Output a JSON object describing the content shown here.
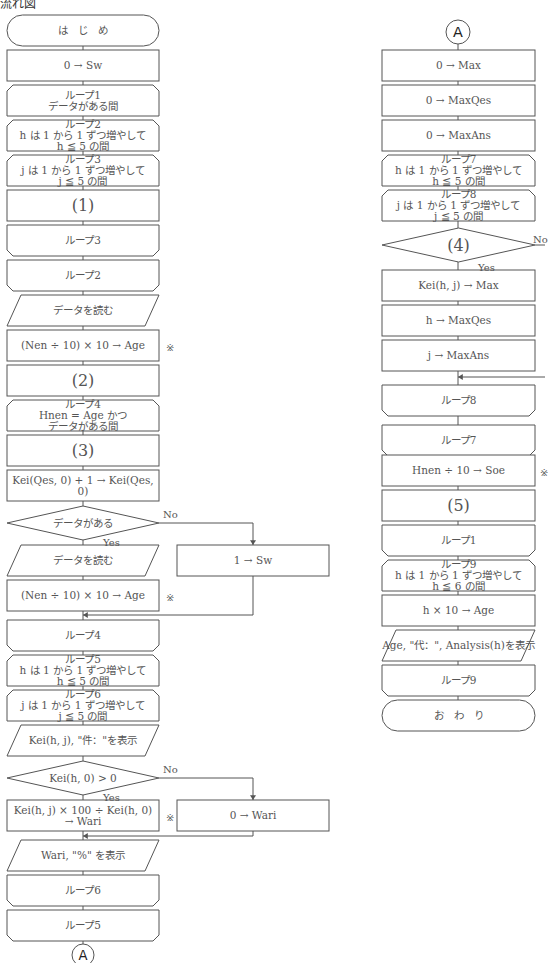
{
  "title": "流れ図",
  "colors": {
    "stroke": "#555555",
    "text": "#555555",
    "background": "#ffffff"
  },
  "left_column": {
    "nodes": [
      {
        "id": "start",
        "shape": "terminal",
        "lines": [
          "は　じ　め"
        ],
        "x": 7,
        "y": 15,
        "w": 152,
        "h": 31
      },
      {
        "id": "init-sw",
        "shape": "process",
        "lines": [
          "0 → Sw"
        ],
        "x": 7,
        "y": 50,
        "w": 152,
        "h": 31
      },
      {
        "id": "loop1-start",
        "shape": "loop-start",
        "lines": [
          "ループ1",
          "データがある間"
        ],
        "x": 7,
        "y": 85,
        "w": 152,
        "h": 31
      },
      {
        "id": "loop2-start",
        "shape": "loop-start",
        "lines": [
          "ループ2",
          "h は 1 から 1 ずつ増やして",
          "h ≦ 5 の間"
        ],
        "x": 7,
        "y": 120,
        "w": 152,
        "h": 31
      },
      {
        "id": "loop3-start",
        "shape": "loop-start",
        "lines": [
          "ループ3",
          "j は 1 から 1 ずつ増やして",
          "j ≦ 5 の間"
        ],
        "x": 7,
        "y": 155,
        "w": 152,
        "h": 31
      },
      {
        "id": "blank-1",
        "shape": "process",
        "lines": [
          "(1)"
        ],
        "big": true,
        "x": 7,
        "y": 190,
        "w": 152,
        "h": 31
      },
      {
        "id": "loop3-end",
        "shape": "loop-end",
        "lines": [
          "ループ3"
        ],
        "x": 7,
        "y": 225,
        "w": 152,
        "h": 31
      },
      {
        "id": "loop2-end",
        "shape": "loop-end",
        "lines": [
          "ループ2"
        ],
        "x": 7,
        "y": 260,
        "w": 152,
        "h": 31
      },
      {
        "id": "read-data-1",
        "shape": "io",
        "lines": [
          "データを読む"
        ],
        "x": 7,
        "y": 295,
        "w": 152,
        "h": 31
      },
      {
        "id": "calc-age-1",
        "shape": "process",
        "lines": [
          "(Nen ÷ 10) × 10 → Age"
        ],
        "x": 7,
        "y": 330,
        "w": 152,
        "h": 31
      },
      {
        "id": "blank-2",
        "shape": "process",
        "lines": [
          "(2)"
        ],
        "big": true,
        "x": 7,
        "y": 365,
        "w": 152,
        "h": 31
      },
      {
        "id": "loop4-start",
        "shape": "loop-start",
        "lines": [
          "ループ4",
          "Hnen = Age かつ",
          "データがある間"
        ],
        "x": 7,
        "y": 400,
        "w": 152,
        "h": 31
      },
      {
        "id": "blank-3",
        "shape": "process",
        "lines": [
          "(3)"
        ],
        "big": true,
        "x": 7,
        "y": 435,
        "w": 152,
        "h": 31
      },
      {
        "id": "incr-kei",
        "shape": "process",
        "lines": [
          "Kei(Qes, 0) + 1 → Kei(Qes, 0)"
        ],
        "x": 7,
        "y": 470,
        "w": 152,
        "h": 31
      },
      {
        "id": "cond-data",
        "shape": "decision",
        "lines": [
          "データがある"
        ],
        "x": 7,
        "y": 506,
        "w": 152,
        "h": 34
      },
      {
        "id": "read-data-2",
        "shape": "io",
        "lines": [
          "データを読む"
        ],
        "x": 7,
        "y": 545,
        "w": 152,
        "h": 31
      },
      {
        "id": "calc-age-2",
        "shape": "process",
        "lines": [
          "(Nen ÷ 10) × 10 → Age"
        ],
        "x": 7,
        "y": 580,
        "w": 152,
        "h": 31
      },
      {
        "id": "loop4-end",
        "shape": "loop-end",
        "lines": [
          "ループ4"
        ],
        "x": 7,
        "y": 620,
        "w": 152,
        "h": 31
      },
      {
        "id": "loop5-start",
        "shape": "loop-start",
        "lines": [
          "ループ5",
          "h は 1 から 1 ずつ増やして",
          "h ≦ 5 の間"
        ],
        "x": 7,
        "y": 655,
        "w": 152,
        "h": 31
      },
      {
        "id": "loop6-start",
        "shape": "loop-start",
        "lines": [
          "ループ6",
          "j は 1 から 1 ずつ増やして",
          "j ≦ 5 の間"
        ],
        "x": 7,
        "y": 690,
        "w": 152,
        "h": 31
      },
      {
        "id": "show-kei",
        "shape": "io",
        "lines": [
          "Kei(h, j), \"件：\"を表示"
        ],
        "x": 7,
        "y": 725,
        "w": 152,
        "h": 31
      },
      {
        "id": "cond-kei",
        "shape": "decision",
        "lines": [
          "Kei(h, 0) > 0"
        ],
        "x": 7,
        "y": 761,
        "w": 152,
        "h": 34
      },
      {
        "id": "calc-wari",
        "shape": "process",
        "lines": [
          "Kei(h, j) × 100 ÷ Kei(h, 0)",
          "→ Wari"
        ],
        "x": 7,
        "y": 800,
        "w": 152,
        "h": 31
      },
      {
        "id": "show-wari",
        "shape": "io",
        "lines": [
          "Wari, \"%\" を表示"
        ],
        "x": 7,
        "y": 840,
        "w": 152,
        "h": 31
      },
      {
        "id": "loop6-end",
        "shape": "loop-end",
        "lines": [
          "ループ6"
        ],
        "x": 7,
        "y": 875,
        "w": 152,
        "h": 31
      },
      {
        "id": "loop5-end",
        "shape": "loop-end",
        "lines": [
          "ループ5"
        ],
        "x": 7,
        "y": 910,
        "w": 152,
        "h": 31
      }
    ],
    "side_nodes": [
      {
        "id": "set-sw-1",
        "shape": "process",
        "lines": [
          "1 → Sw"
        ],
        "x": 177,
        "y": 545,
        "w": 152,
        "h": 31
      },
      {
        "id": "set-wari-0",
        "shape": "process",
        "lines": [
          "0 → Wari"
        ],
        "x": 177,
        "y": 800,
        "w": 152,
        "h": 31
      }
    ],
    "connector": {
      "label": "A",
      "x": 83,
      "y": 955,
      "r": 11
    },
    "branch_labels": [
      {
        "text": "No",
        "x": 163,
        "y": 509
      },
      {
        "text": "Yes",
        "x": 103,
        "y": 537
      },
      {
        "text": "No",
        "x": 163,
        "y": 764
      },
      {
        "text": "Yes",
        "x": 103,
        "y": 792
      }
    ],
    "notes": [
      {
        "text": "※",
        "x": 166,
        "y": 342
      },
      {
        "text": "※",
        "x": 166,
        "y": 592
      },
      {
        "text": "※",
        "x": 166,
        "y": 812
      }
    ]
  },
  "right_column": {
    "connector": {
      "label": "A",
      "x": 458,
      "y": 32,
      "r": 12
    },
    "nodes": [
      {
        "id": "init-max",
        "shape": "process",
        "lines": [
          "0 → Max"
        ],
        "x": 382,
        "y": 50,
        "w": 153,
        "h": 31
      },
      {
        "id": "init-maxqes",
        "shape": "process",
        "lines": [
          "0 → MaxQes"
        ],
        "x": 382,
        "y": 85,
        "w": 153,
        "h": 31
      },
      {
        "id": "init-maxans",
        "shape": "process",
        "lines": [
          "0 → MaxAns"
        ],
        "x": 382,
        "y": 120,
        "w": 153,
        "h": 31
      },
      {
        "id": "loop7-start",
        "shape": "loop-start",
        "lines": [
          "ループ7",
          "h は 1 から 1 ずつ増やして",
          "h ≦ 5 の間"
        ],
        "x": 382,
        "y": 155,
        "w": 153,
        "h": 31
      },
      {
        "id": "loop8-start",
        "shape": "loop-start",
        "lines": [
          "ループ8",
          "j は 1 から 1 ずつ増やして",
          "j ≦ 5 の間"
        ],
        "x": 382,
        "y": 190,
        "w": 153,
        "h": 31
      },
      {
        "id": "blank-4",
        "shape": "decision",
        "lines": [
          "(4)"
        ],
        "big": true,
        "x": 382,
        "y": 228,
        "w": 153,
        "h": 34
      },
      {
        "id": "set-max",
        "shape": "process",
        "lines": [
          "Kei(h, j) → Max"
        ],
        "x": 382,
        "y": 270,
        "w": 153,
        "h": 31
      },
      {
        "id": "set-maxqes",
        "shape": "process",
        "lines": [
          "h → MaxQes"
        ],
        "x": 382,
        "y": 305,
        "w": 153,
        "h": 31
      },
      {
        "id": "set-maxans",
        "shape": "process",
        "lines": [
          "j → MaxAns"
        ],
        "x": 382,
        "y": 340,
        "w": 153,
        "h": 31
      },
      {
        "id": "loop8-end",
        "shape": "loop-end",
        "lines": [
          "ループ8"
        ],
        "x": 382,
        "y": 385,
        "w": 153,
        "h": 31
      },
      {
        "id": "loop7-end",
        "shape": "loop-end",
        "lines": [
          "ループ7"
        ],
        "x": 382,
        "y": 425,
        "w": 153,
        "h": 31
      },
      {
        "id": "calc-soe",
        "shape": "process",
        "lines": [
          "Hnen ÷ 10 → Soe"
        ],
        "x": 382,
        "y": 455,
        "w": 153,
        "h": 31
      },
      {
        "id": "blank-5",
        "shape": "process",
        "lines": [
          "(5)"
        ],
        "big": true,
        "x": 382,
        "y": 490,
        "w": 153,
        "h": 31
      },
      {
        "id": "loop1-end",
        "shape": "loop-end",
        "lines": [
          "ループ1"
        ],
        "x": 382,
        "y": 525,
        "w": 153,
        "h": 31
      },
      {
        "id": "loop9-start",
        "shape": "loop-start",
        "lines": [
          "ループ9",
          "h は 1 から 1 ずつ増やして",
          "h ≦ 6 の間"
        ],
        "x": 382,
        "y": 560,
        "w": 153,
        "h": 31
      },
      {
        "id": "calc-age-3",
        "shape": "process",
        "lines": [
          "h × 10 → Age"
        ],
        "x": 382,
        "y": 595,
        "w": 153,
        "h": 31
      },
      {
        "id": "show-analysis",
        "shape": "io",
        "lines": [
          "Age, \"代：\", Analysis(h)を表示"
        ],
        "x": 382,
        "y": 630,
        "w": 153,
        "h": 31
      },
      {
        "id": "loop9-end",
        "shape": "loop-end",
        "lines": [
          "ループ9"
        ],
        "x": 382,
        "y": 665,
        "w": 153,
        "h": 31
      },
      {
        "id": "end",
        "shape": "terminal",
        "lines": [
          "お　わ　り"
        ],
        "x": 382,
        "y": 700,
        "w": 153,
        "h": 31
      }
    ],
    "branch_labels": [
      {
        "text": "No",
        "x": 533,
        "y": 234
      },
      {
        "text": "Yes",
        "x": 478,
        "y": 262
      }
    ],
    "notes": [
      {
        "text": "※",
        "x": 540,
        "y": 467
      }
    ]
  }
}
